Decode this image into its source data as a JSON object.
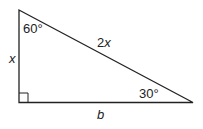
{
  "diagram": {
    "type": "right-triangle",
    "angles": {
      "top": "60°",
      "right": "30°",
      "bottom_left": "right-angle"
    },
    "sides": {
      "left": "x",
      "hypotenuse": "2x",
      "bottom": "b"
    },
    "colors": {
      "stroke": "#222222",
      "background": "#ffffff"
    }
  }
}
